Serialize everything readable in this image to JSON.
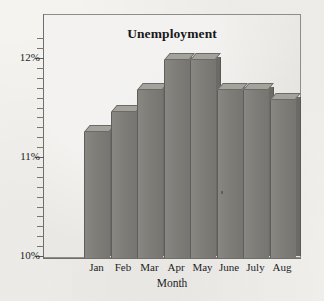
{
  "chart_data": {
    "type": "bar",
    "title": "Unemployment",
    "xlabel": "Month",
    "ylabel": "",
    "categories": [
      "Jan",
      "Feb",
      "Mar",
      "Apr",
      "May",
      "June",
      "July",
      "Aug"
    ],
    "values": [
      11.25,
      11.45,
      11.68,
      11.98,
      11.98,
      11.68,
      11.68,
      11.58
    ],
    "ylim": [
      10,
      12
    ],
    "ytick_labels": [
      "12%",
      "11%",
      "10%"
    ],
    "ytick_values": [
      12,
      11,
      10
    ],
    "minor_ticks": true,
    "grid": false,
    "legend": null,
    "style": "3d-bar",
    "bar_color": "#7e7d77",
    "bar_top_color": "#a3a29b",
    "bar_side_color": "#6b6a65",
    "plot_background": "#e9e8e4",
    "page_background": "#f4f3ef"
  }
}
